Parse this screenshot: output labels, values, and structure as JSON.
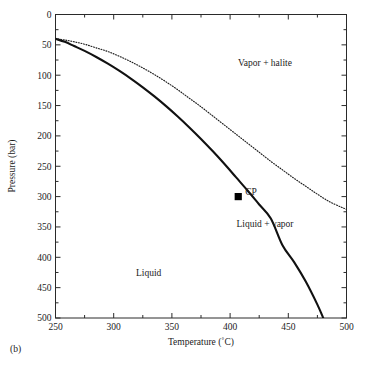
{
  "figure": {
    "panel_label": "(b)",
    "ghost_title_fragment": "",
    "background_color": "#ffffff",
    "ink_color": "#111111"
  },
  "chart_data": {
    "type": "line",
    "title": "",
    "xlabel": "Temperature (˚C)",
    "ylabel": "Pressure (bar)",
    "xlim": [
      250,
      500
    ],
    "ylim": [
      500,
      0
    ],
    "y_inverted": true,
    "grid": false,
    "legend_position": "none",
    "x_ticks_major": [
      250,
      300,
      350,
      400,
      450,
      500
    ],
    "x_tick_labels": [
      "250",
      "300",
      "350",
      "400",
      "450",
      "500"
    ],
    "x_ticks_minor": [
      275,
      325,
      375,
      425,
      475
    ],
    "y_ticks_major": [
      0,
      50,
      100,
      150,
      200,
      250,
      300,
      350,
      400,
      450,
      500
    ],
    "y_tick_labels": [
      "0",
      "50",
      "100",
      "150",
      "200",
      "250",
      "300",
      "350",
      "400",
      "450",
      "500"
    ],
    "y_ticks_minor": [
      25,
      75,
      125,
      175,
      225,
      275,
      325,
      375,
      425,
      475
    ],
    "series": [
      {
        "name": "Liquid-vapor boundary (two-phase curve)",
        "style": "solid",
        "linewidth": 2.1,
        "color": "#111111",
        "x": [
          250,
          258,
          266,
          275,
          285,
          295,
          305,
          315,
          325,
          335,
          345,
          355,
          365,
          375,
          385,
          395,
          405,
          415,
          425,
          435,
          445,
          455,
          465,
          475,
          480
        ],
        "y": [
          40,
          45,
          52,
          60,
          70,
          81,
          93,
          106,
          120,
          135,
          151,
          168,
          186,
          205,
          225,
          246,
          268,
          290,
          313,
          336,
          380,
          408,
          440,
          478,
          500
        ]
      },
      {
        "name": "Vapor + halite boundary (halite saturation)",
        "style": "dotted",
        "linewidth": 1.15,
        "color": "#1e1e1e",
        "x": [
          250,
          258,
          266,
          275,
          285,
          295,
          305,
          315,
          325,
          335,
          345,
          355,
          365,
          375,
          385,
          395,
          405,
          415,
          425,
          435,
          445,
          455,
          465,
          475,
          485,
          495,
          500
        ],
        "y": [
          40,
          42,
          45,
          49,
          55,
          61,
          69,
          78,
          88,
          99,
          111,
          124,
          138,
          152,
          167,
          182,
          197,
          212,
          227,
          242,
          256,
          270,
          283,
          296,
          308,
          317,
          321
        ]
      }
    ],
    "points": [
      {
        "label": "CP",
        "marker": "filled-square",
        "x": 407,
        "y": 300,
        "color": "#000000"
      }
    ],
    "annotations": [
      {
        "text": "Vapor + halite",
        "x": 430,
        "y": 80
      },
      {
        "text": "Liquid + vapor",
        "x": 430,
        "y": 345
      },
      {
        "text": "Liquid",
        "x": 330,
        "y": 425
      },
      {
        "text": "CP",
        "x": 418,
        "y": 292
      }
    ]
  }
}
